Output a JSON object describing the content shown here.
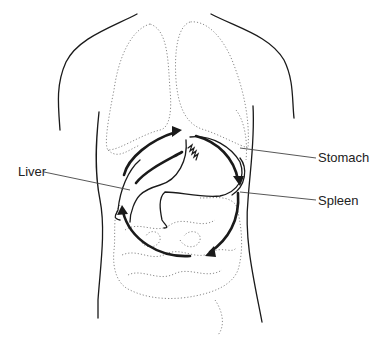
{
  "labels": {
    "liver": "Liver",
    "stomach": "Stomach",
    "spleen": "Spleen"
  },
  "colors": {
    "outline": "#1a1a1a",
    "dotted": "#8a8a8a",
    "leader": "#444444",
    "text": "#222222"
  }
}
